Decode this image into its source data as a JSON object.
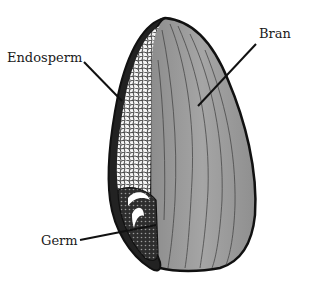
{
  "diagram": {
    "labels": [
      {
        "id": "endosperm",
        "text": "Endosperm"
      },
      {
        "id": "bran",
        "text": "Bran"
      },
      {
        "id": "germ",
        "text": "Germ"
      }
    ],
    "colors": {
      "background": "#ffffff",
      "outline": "#1a1a1a",
      "bran_fill": "#9a9a9a",
      "bran_fill_light": "#b5b5b5",
      "endosperm_fill": "#f2f2f2",
      "germ_fill": "#3a3a3a",
      "leader_line": "#1a1a1a"
    }
  }
}
